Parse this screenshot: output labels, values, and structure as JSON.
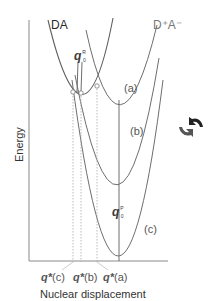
{
  "diagram": {
    "type": "potential energy curves (Marcus theory)",
    "axes": {
      "y_label": "Energy",
      "x_label": "Nuclear displacement"
    },
    "curves": [
      {
        "id": "DA",
        "label": "DA",
        "role": "reactant",
        "vertex": [
          84,
          95
        ]
      },
      {
        "id": "a",
        "label": "(a)",
        "role": "product",
        "vertex": [
          119,
          106
        ]
      },
      {
        "id": "b",
        "label": "(b)",
        "role": "product",
        "vertex": [
          119,
          189
        ]
      },
      {
        "id": "c",
        "label": "(c)",
        "role": "product",
        "vertex": [
          119,
          256
        ]
      }
    ],
    "product_label": "D⁺A⁻",
    "reactant_label": "DA",
    "q0R": {
      "base": "q",
      "sup": "R",
      "sub": "0"
    },
    "q0P": {
      "base": "q",
      "sup": "P",
      "sub": "0"
    },
    "crossing_labels": {
      "c": {
        "base": "q*",
        "suffix": "(c)"
      },
      "b": {
        "base": "q*",
        "suffix": "(b)"
      },
      "a": {
        "base": "q*",
        "suffix": "(a)"
      }
    },
    "curve_labels": {
      "a": "(a)",
      "b": "(b)",
      "c": "(c)"
    },
    "colors": {
      "axis": "#8a8a8a",
      "curve": "#6e6e6e",
      "dotted": "#aaaaaa",
      "marker_fill": "#ffffff",
      "icon_dark": "#222222",
      "icon_mid": "#555555"
    },
    "icon": "rotate-arrows-icon"
  }
}
